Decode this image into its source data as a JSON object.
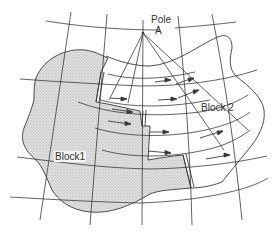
{
  "diagram": {
    "type": "plate-rotation-schematic",
    "labels": {
      "pole": "Pole",
      "pole_letter": "A",
      "block1": "Block1",
      "block2": "Block 2"
    },
    "colors": {
      "line": "#3a3a3a",
      "block1_fill": "#d4d4d4",
      "background": "#ffffff"
    },
    "elements": {
      "pole_point": [
        143,
        33
      ],
      "grid": "curvilinear latitude/longitude graticule",
      "rays_from_pole": 4,
      "motion_arrows": 11,
      "shaded_block": "Block1 (stippled)",
      "unshaded_block": "Block 2"
    }
  }
}
